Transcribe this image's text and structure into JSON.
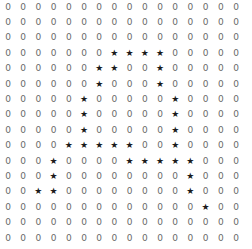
{
  "grid": {
    "rows": 16,
    "cols": 16,
    "zero_symbol": "0",
    "star_symbol": "★",
    "cells": [
      "0000000000000000",
      "0000000000000000",
      "0000000000000000",
      "0000000****00000",
      "000000**00*00000",
      "000000*000*00000",
      "00000*00000*0000",
      "00000*00000*0000",
      "00000*00000*0000",
      "0000*****00*0000",
      "000*0000*****000",
      "000*00000000*000",
      "00**00000000*000",
      "0000000000000*00",
      "0000000000000000",
      "0000000000000000"
    ]
  }
}
